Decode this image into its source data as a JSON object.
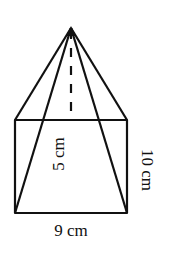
{
  "diagram": {
    "type": "square-pyramid",
    "labels": {
      "base_width": "9 cm",
      "slant_height": "10 cm",
      "height": "5 cm"
    },
    "colors": {
      "stroke": "#111111",
      "background": "#ffffff"
    }
  }
}
